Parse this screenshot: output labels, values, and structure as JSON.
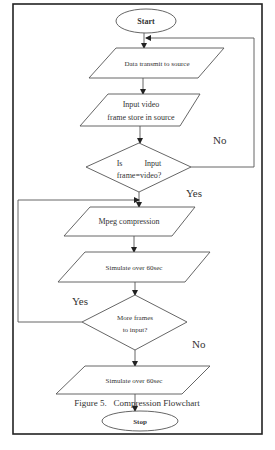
{
  "diagram": {
    "type": "flowchart",
    "caption": "Figure 5.   Compression Flowchart",
    "nodes": [
      {
        "id": "start",
        "shape": "ellipse",
        "label": "Start"
      },
      {
        "id": "data_transmit",
        "shape": "parallelogram",
        "label": "Data transmit to source"
      },
      {
        "id": "input_video",
        "shape": "parallelogram",
        "lines": [
          "Input video",
          "frame store in source"
        ]
      },
      {
        "id": "decision_input",
        "shape": "diamond",
        "lines": [
          "Is           Input",
          "frame=video?"
        ]
      },
      {
        "id": "mpeg",
        "shape": "parallelogram",
        "label": "Mpeg compression"
      },
      {
        "id": "simulate1",
        "shape": "parallelogram",
        "label": "Simulate over 60sec"
      },
      {
        "id": "decision_more",
        "shape": "diamond",
        "lines": [
          "More frames",
          "to input?"
        ]
      },
      {
        "id": "simulate2",
        "shape": "parallelogram",
        "label": "Simulate over 60sec"
      },
      {
        "id": "stop",
        "shape": "ellipse",
        "label": "Stop"
      }
    ],
    "edges": [
      {
        "from": "start",
        "to": "data_transmit"
      },
      {
        "from": "data_transmit",
        "to": "input_video"
      },
      {
        "from": "input_video",
        "to": "decision_input"
      },
      {
        "from": "decision_input",
        "to": "data_transmit",
        "label": "No"
      },
      {
        "from": "decision_input",
        "to": "mpeg",
        "label": "Yes"
      },
      {
        "from": "mpeg",
        "to": "simulate1"
      },
      {
        "from": "simulate1",
        "to": "decision_more"
      },
      {
        "from": "decision_more",
        "to": "mpeg",
        "label": "Yes"
      },
      {
        "from": "decision_more",
        "to": "simulate2",
        "label": "No"
      },
      {
        "from": "simulate2",
        "to": "stop"
      }
    ],
    "edge_labels": {
      "no1": "No",
      "yes1": "Yes",
      "yes2": "Yes",
      "no2": "No"
    }
  }
}
